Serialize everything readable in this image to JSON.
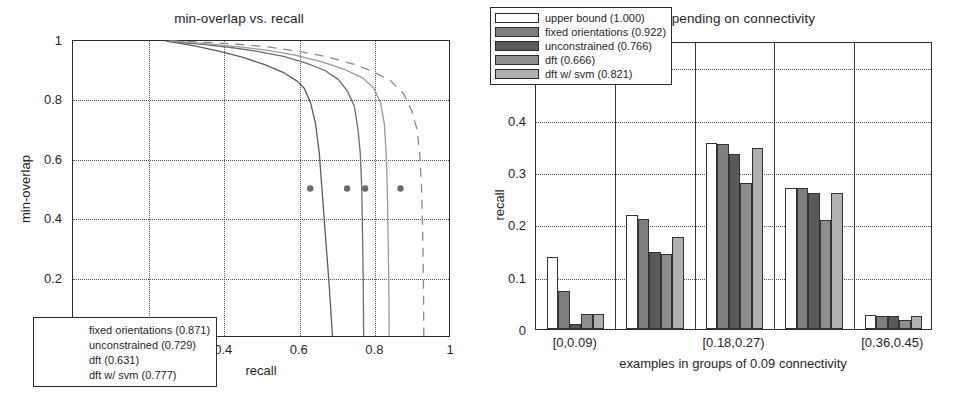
{
  "figure": {
    "width": 957,
    "height": 393,
    "background": "#ffffff"
  },
  "chart_data": [
    {
      "id": "left",
      "type": "line",
      "title": "min-overlap vs. recall",
      "xlabel": "recall",
      "ylabel": "min-overlap",
      "xlim": [
        0,
        1
      ],
      "ylim": [
        0,
        1
      ],
      "xticks": [
        "0",
        "0.2",
        "0.4",
        "0.6",
        "0.8",
        "1"
      ],
      "xtick_values": [
        0,
        0.2,
        0.4,
        0.6,
        0.8,
        1
      ],
      "yticks": [
        "0",
        "0.2",
        "0.4",
        "0.6",
        "0.8",
        "1"
      ],
      "ytick_values": [
        0,
        0.2,
        0.4,
        0.6,
        0.8,
        1
      ],
      "grid": "dotted",
      "legend_position": "lower-left",
      "marker_y": 0.5,
      "series": [
        {
          "name": "fixed orientations (0.871)",
          "label": "fixed orientations (0.871)",
          "score": 0.871,
          "style": "dashed",
          "color": "#8a8a8a",
          "marker_x": 0.871,
          "points": [
            [
              0.262,
              1.0
            ],
            [
              0.3,
              0.998
            ],
            [
              0.36,
              0.995
            ],
            [
              0.43,
              0.99
            ],
            [
              0.52,
              0.98
            ],
            [
              0.6,
              0.965
            ],
            [
              0.68,
              0.945
            ],
            [
              0.75,
              0.92
            ],
            [
              0.8,
              0.895
            ],
            [
              0.845,
              0.865
            ],
            [
              0.88,
              0.82
            ],
            [
              0.902,
              0.76
            ],
            [
              0.915,
              0.7
            ],
            [
              0.922,
              0.62
            ],
            [
              0.927,
              0.5
            ],
            [
              0.93,
              0.35
            ],
            [
              0.932,
              0.18
            ],
            [
              0.933,
              0.0
            ]
          ]
        },
        {
          "name": "unconstrained (0.729)",
          "label": "unconstrained (0.729)",
          "score": 0.729,
          "style": "solid",
          "color": "#6e6e6e",
          "marker_x": 0.729,
          "points": [
            [
              0.25,
              1.0
            ],
            [
              0.29,
              0.995
            ],
            [
              0.35,
              0.988
            ],
            [
              0.42,
              0.978
            ],
            [
              0.49,
              0.965
            ],
            [
              0.56,
              0.948
            ],
            [
              0.62,
              0.925
            ],
            [
              0.67,
              0.9
            ],
            [
              0.705,
              0.87
            ],
            [
              0.73,
              0.83
            ],
            [
              0.748,
              0.78
            ],
            [
              0.758,
              0.7
            ],
            [
              0.764,
              0.62
            ],
            [
              0.768,
              0.5
            ],
            [
              0.77,
              0.35
            ],
            [
              0.772,
              0.18
            ],
            [
              0.773,
              0.0
            ]
          ]
        },
        {
          "name": "dft (0.631)",
          "label": "dft (0.631)",
          "score": 0.631,
          "style": "solid",
          "color": "#5c5c5c",
          "marker_x": 0.631,
          "points": [
            [
              0.248,
              1.0
            ],
            [
              0.285,
              0.992
            ],
            [
              0.33,
              0.982
            ],
            [
              0.39,
              0.965
            ],
            [
              0.45,
              0.945
            ],
            [
              0.51,
              0.92
            ],
            [
              0.56,
              0.893
            ],
            [
              0.595,
              0.865
            ],
            [
              0.615,
              0.84
            ],
            [
              0.632,
              0.79
            ],
            [
              0.645,
              0.72
            ],
            [
              0.655,
              0.62
            ],
            [
              0.662,
              0.5
            ],
            [
              0.672,
              0.33
            ],
            [
              0.682,
              0.16
            ],
            [
              0.69,
              0.0
            ]
          ]
        },
        {
          "name": "dft w/ svm (0.777)",
          "label": "dft w/ svm (0.777)",
          "score": 0.777,
          "style": "solid",
          "color": "#9a9a9a",
          "marker_x": 0.777,
          "points": [
            [
              0.256,
              1.0
            ],
            [
              0.3,
              0.996
            ],
            [
              0.36,
              0.99
            ],
            [
              0.43,
              0.982
            ],
            [
              0.51,
              0.97
            ],
            [
              0.59,
              0.952
            ],
            [
              0.66,
              0.93
            ],
            [
              0.72,
              0.905
            ],
            [
              0.77,
              0.875
            ],
            [
              0.8,
              0.84
            ],
            [
              0.818,
              0.79
            ],
            [
              0.828,
              0.72
            ],
            [
              0.833,
              0.62
            ],
            [
              0.836,
              0.5
            ],
            [
              0.838,
              0.34
            ],
            [
              0.84,
              0.17
            ],
            [
              0.841,
              0.0
            ]
          ]
        }
      ]
    },
    {
      "id": "right",
      "type": "bar",
      "title": "recall depending on connectivity",
      "xlabel": "examples in groups of 0.09 connectivity",
      "ylabel": "recall",
      "ylim": [
        0,
        0.55
      ],
      "yticks": [
        "0",
        "0.1",
        "0.2",
        "0.3",
        "0.4",
        "0.5"
      ],
      "ytick_values": [
        0,
        0.1,
        0.2,
        0.3,
        0.4,
        0.5
      ],
      "grid": "dotted-horizontal",
      "legend_position": "upper-left",
      "categories": [
        "[0,0.09)",
        "[0.09,0.18)",
        "[0.18,0.27)",
        "[0.27,0.36)",
        "[0.36,0.45)"
      ],
      "visible_tick_labels": [
        "[0,0.09)",
        "[0.18,0.27)",
        "[0.36,0.45)"
      ],
      "visible_tick_indices": [
        0,
        2,
        4
      ],
      "series": [
        {
          "name": "upper bound (1.000)",
          "label": "upper bound (1.000)",
          "score": 1.0,
          "color": "#ffffff",
          "values": [
            0.137,
            0.218,
            0.356,
            0.27,
            0.026
          ]
        },
        {
          "name": "fixed orientations (0.922)",
          "label": "fixed orientations (0.922)",
          "score": 0.922,
          "color": "#7e7e7e",
          "values": [
            0.072,
            0.21,
            0.354,
            0.269,
            0.025
          ]
        },
        {
          "name": "unconstrained (0.766)",
          "label": "unconstrained (0.766)",
          "score": 0.766,
          "color": "#5a5a5a",
          "values": [
            0.01,
            0.147,
            0.334,
            0.26,
            0.025
          ]
        },
        {
          "name": "dft (0.666)",
          "label": "dft (0.666)",
          "score": 0.666,
          "color": "#8e8e8e",
          "values": [
            0.028,
            0.144,
            0.278,
            0.208,
            0.018
          ]
        },
        {
          "name": "dft w/ svm (0.821)",
          "label": "dft w/ svm (0.821)",
          "score": 0.821,
          "color": "#b0b0b0",
          "values": [
            0.028,
            0.175,
            0.345,
            0.26,
            0.025
          ]
        }
      ]
    }
  ]
}
